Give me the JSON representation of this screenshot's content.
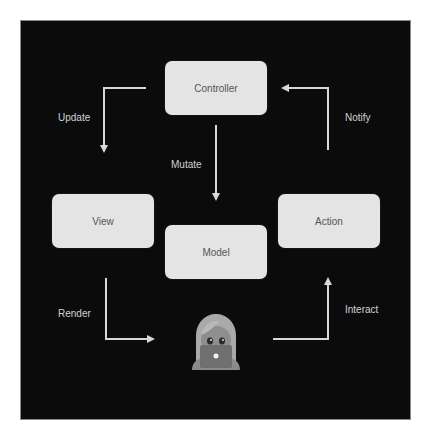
{
  "diagram": {
    "title": "",
    "type": "MVC flow",
    "background_color": "#0b0b0b",
    "node_color": "#e4e4e4",
    "edge_color": "#d8d8d8",
    "nodes": [
      {
        "id": "controller",
        "label": "Controller"
      },
      {
        "id": "view",
        "label": "View"
      },
      {
        "id": "model",
        "label": "Model"
      },
      {
        "id": "action",
        "label": "Action"
      },
      {
        "id": "user",
        "label": "",
        "icon": "woman-with-laptop-icon"
      }
    ],
    "edges": [
      {
        "from": "controller",
        "to": "view",
        "label": "Update"
      },
      {
        "from": "controller",
        "to": "model",
        "label": "Mutate"
      },
      {
        "from": "action",
        "to": "controller",
        "label": "Notify"
      },
      {
        "from": "view",
        "to": "user",
        "label": "Render"
      },
      {
        "from": "user",
        "to": "action",
        "label": "Interact"
      }
    ]
  },
  "nodes": {
    "controller": "Controller",
    "view": "View",
    "model": "Model",
    "action": "Action"
  },
  "edges": {
    "update": "Update",
    "mutate": "Mutate",
    "notify": "Notify",
    "render": "Render",
    "interact": "Interact"
  }
}
